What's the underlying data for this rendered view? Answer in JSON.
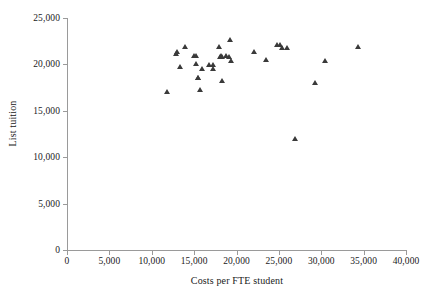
{
  "chart_data": {
    "type": "scatter",
    "title": "",
    "xlabel": "Costs per FTE student",
    "ylabel": "List tuition",
    "xlim": [
      0,
      40000
    ],
    "ylim": [
      0,
      25000
    ],
    "grid": false,
    "legend": false,
    "marker": "triangle",
    "marker_color": "#3a3a3a",
    "xticks": [
      0,
      5000,
      10000,
      15000,
      20000,
      25000,
      30000,
      35000,
      40000
    ],
    "xtick_labels": [
      "0",
      "5,000",
      "10,000",
      "15,000",
      "20,000",
      "25,000",
      "30,000",
      "35,000",
      "40,000"
    ],
    "yticks": [
      0,
      5000,
      10000,
      15000,
      20000,
      25000
    ],
    "ytick_labels": [
      "0",
      "5,000",
      "10,000",
      "15,000",
      "20,000",
      "25,000"
    ],
    "series": [
      {
        "name": "Institutions",
        "points": [
          {
            "x": 11800,
            "y": 17100
          },
          {
            "x": 12900,
            "y": 21200
          },
          {
            "x": 13000,
            "y": 21400
          },
          {
            "x": 13400,
            "y": 19750
          },
          {
            "x": 13900,
            "y": 21900
          },
          {
            "x": 15000,
            "y": 20950
          },
          {
            "x": 15200,
            "y": 20900
          },
          {
            "x": 15200,
            "y": 20050
          },
          {
            "x": 15500,
            "y": 18600
          },
          {
            "x": 15500,
            "y": 18550
          },
          {
            "x": 15700,
            "y": 17300
          },
          {
            "x": 15900,
            "y": 19500
          },
          {
            "x": 16800,
            "y": 20000
          },
          {
            "x": 17200,
            "y": 19950
          },
          {
            "x": 17200,
            "y": 19550
          },
          {
            "x": 18000,
            "y": 21900
          },
          {
            "x": 18100,
            "y": 20850
          },
          {
            "x": 18200,
            "y": 20950
          },
          {
            "x": 18300,
            "y": 20850
          },
          {
            "x": 18300,
            "y": 18200
          },
          {
            "x": 18800,
            "y": 20900
          },
          {
            "x": 19100,
            "y": 20800
          },
          {
            "x": 19200,
            "y": 22700
          },
          {
            "x": 19400,
            "y": 20350
          },
          {
            "x": 22100,
            "y": 21400
          },
          {
            "x": 23500,
            "y": 20500
          },
          {
            "x": 24800,
            "y": 22100
          },
          {
            "x": 25100,
            "y": 22100
          },
          {
            "x": 25400,
            "y": 21800
          },
          {
            "x": 26000,
            "y": 21850
          },
          {
            "x": 26900,
            "y": 12000
          },
          {
            "x": 29300,
            "y": 18000
          },
          {
            "x": 30400,
            "y": 20450
          },
          {
            "x": 34400,
            "y": 21900
          }
        ]
      }
    ]
  }
}
